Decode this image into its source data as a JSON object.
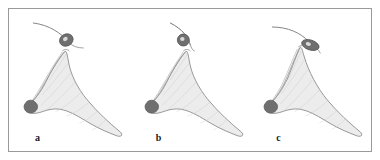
{
  "figure": {
    "type": "line-drawing-plate",
    "panel_count": 3,
    "background_color": "#ffffff",
    "frame_color": "#9a9a9a",
    "outline_color": "#8d8d8d",
    "fill_color": "#ececec",
    "dark_accent_color": "#6f6f6f",
    "filament_color": "#777777"
  },
  "panels": [
    {
      "label": "a",
      "name": "panel-a",
      "description": "Funnel-shaped structure with dark wedge tip at lower left and long tapering tail to lower right; curved filament with small dark oval above",
      "filament_path": "M 24 14 C 40 16 52 24 60 34",
      "filament_tail_path": "M 60 34 C 63 37 68 39 74 39",
      "blob_cx": 57,
      "blob_cy": 31,
      "blob_rx": 7,
      "blob_ry": 6,
      "blob_rotation": -28,
      "body_path": "M 56 42 C 50 48 44 58 38 70 C 33 80 28 88 22 93 C 19 96 17 99 18 102 C 20 105 26 105 32 103 C 40 100 47 99 54 101 C 62 103 70 108 80 114 C 90 120 100 124 108 127 C 112 128 114 126 111 123 C 100 114 88 103 78 91 C 68 79 61 65 59 52 C 58 47 58 44 56 42 Z",
      "rib_paths": [
        "M 57 45 C 52 53 46 62 40 71",
        "M 59 54 C 51 64 42 76 33 86",
        "M 62 63 C 53 74 43 86 32 96",
        "M 66 73 C 56 84 46 94 36 102",
        "M 72 83 C 63 92 54 99 46 103",
        "M 80 93 C 72 100 64 105 57 107",
        "M 88 102 C 82 108 76 112 70 114",
        "M 96 111 C 92 116 87 119 83 121"
      ],
      "edge_band_paths": [
        "M 55 43 C 48 52 41 64 34 76 C 29 85 24 92 19 98",
        "M 53 43 C 46 53 39 65 32 77 C 27 86 22 93 17 99"
      ],
      "wedge_path": "M 18 92 C 22 90 26 92 28 96 C 29 100 26 104 21 104 C 16 104 14 99 15 96 C 16 94 17 93 18 92 Z",
      "neck_path": "M 53 42 C 55 40 58 40 60 42"
    },
    {
      "label": "b",
      "name": "panel-b",
      "description": "Same structure with a steeper, more vertical curved filament and dark oval positioned close to the apex",
      "filament_path": "M 40 14 C 52 20 58 28 60 36",
      "filament_tail_path": "M 60 36 C 61 39 62 41 64 42",
      "blob_cx": 53,
      "blob_cy": 31,
      "blob_rx": 6,
      "blob_ry": 6,
      "blob_rotation": -10,
      "body_path": "M 56 42 C 50 48 44 58 38 70 C 33 80 28 88 22 93 C 19 96 17 99 18 102 C 20 105 26 105 32 103 C 40 100 47 99 54 101 C 62 103 70 108 80 114 C 90 120 100 124 108 127 C 112 128 114 126 111 123 C 100 114 88 103 78 91 C 68 79 61 65 59 52 C 58 47 58 44 56 42 Z",
      "rib_paths": [
        "M 57 45 C 52 53 46 62 40 71",
        "M 59 54 C 51 64 42 76 33 86",
        "M 62 63 C 53 74 43 86 32 96",
        "M 66 73 C 56 84 46 94 36 102",
        "M 72 83 C 63 92 54 99 46 103",
        "M 80 93 C 72 100 64 105 57 107",
        "M 88 102 C 82 108 76 112 70 114",
        "M 96 111 C 92 116 87 119 83 121"
      ],
      "edge_band_paths": [
        "M 55 43 C 48 52 41 64 34 76 C 29 85 24 92 19 98",
        "M 53 43 C 46 53 39 65 32 77 C 27 86 22 93 17 99"
      ],
      "wedge_path": "M 18 92 C 22 90 26 92 28 96 C 29 100 26 104 21 104 C 16 104 14 99 15 96 C 16 94 17 93 18 92 Z",
      "neck_path": "M 53 42 C 55 40 58 40 60 42"
    },
    {
      "label": "c",
      "name": "panel-c",
      "description": "Same structure with a shallow curved filament sweeping right and an elongated dark oval lying near-horizontally at the apex",
      "filament_path": "M 22 18 C 38 18 50 24 58 32",
      "filament_tail_path": "M 58 32 C 63 36 68 40 70 44",
      "blob_cx": 60,
      "blob_cy": 36,
      "blob_rx": 9,
      "blob_ry": 5,
      "blob_rotation": 18,
      "body_path": "M 50 38 C 46 46 42 58 37 70 C 32 80 27 88 21 93 C 18 96 16 99 17 102 C 19 105 25 105 31 103 C 39 100 46 99 53 101 C 61 103 69 108 79 114 C 89 120 99 124 107 127 C 111 128 113 126 110 123 C 99 114 87 103 77 91 C 67 79 58 62 54 48 C 52 42 52 39 50 38 Z",
      "rib_paths": [
        "M 51 42 C 47 50 43 60 38 70",
        "M 54 51 C 47 62 39 74 31 85",
        "M 57 61 C 49 72 40 85 30 95",
        "M 62 71 C 53 82 44 93 34 101",
        "M 69 81 C 61 90 52 98 44 103",
        "M 78 91 C 70 99 62 104 55 107",
        "M 87 101 C 81 107 75 111 69 114",
        "M 95 110 C 91 115 86 118 82 120"
      ],
      "edge_band_paths": [
        "M 49 39 C 44 50 39 63 33 76 C 28 85 23 92 18 98",
        "M 47 40 C 42 51 37 64 31 77 C 26 86 21 93 16 99"
      ],
      "wedge_path": "M 17 92 C 21 90 25 92 27 96 C 28 100 25 104 20 104 C 15 104 13 99 14 96 C 15 94 16 93 17 92 Z",
      "neck_path": "M 48 38 C 50 36 53 36 55 39"
    }
  ]
}
